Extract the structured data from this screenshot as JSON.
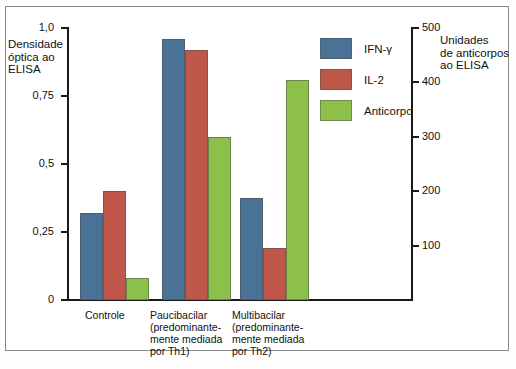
{
  "chart_data": {
    "type": "bar",
    "title": "",
    "categories": [
      "Controle",
      "Paucibacilar (predominantemente mediada por Th1)",
      "Multibacilar (predominantemente mediada por Th2)"
    ],
    "category_lines": [
      [
        "Controle"
      ],
      [
        "Paucibacilar",
        "(predominante-",
        "mente mediada",
        "por Th1)"
      ],
      [
        "Multibacilar",
        "(predominante-",
        "mente mediada",
        "por Th2)"
      ]
    ],
    "series": [
      {
        "name": "IFN-γ",
        "axis": "left",
        "color": "#4a7296",
        "values": [
          0.32,
          0.96,
          0.375
        ]
      },
      {
        "name": "IL-2",
        "axis": "left",
        "color": "#c0574b",
        "values": [
          0.4,
          0.92,
          0.19
        ]
      },
      {
        "name": "Anticorpo",
        "axis": "right",
        "color": "#8cc04a",
        "values": [
          0.08,
          0.6,
          0.81
        ]
      }
    ],
    "anticorpo_right_axis_values": [
      40,
      300,
      405
    ],
    "ylabel": "Densidade óptica ao ELISA",
    "ylabel_lines": [
      "Densidade",
      "óptica ao",
      "ELISA"
    ],
    "ylabel_right": "Unidades de anticorpos ao ELISA",
    "ylabel_right_lines": [
      "Unidades",
      "de anticorpos",
      "ao ELISA"
    ],
    "xlabel": "",
    "ylim": [
      0,
      1.0
    ],
    "ylim_right": [
      0,
      500
    ],
    "yticks": [
      0,
      0.25,
      0.5,
      0.75,
      1.0
    ],
    "ytick_labels": [
      "0",
      "0,25",
      "0,5",
      "0,75",
      "1,0"
    ],
    "yticks_right": [
      100,
      200,
      300,
      400,
      500
    ],
    "ytick_labels_right": [
      "100",
      "200",
      "300",
      "400",
      "500"
    ],
    "grid": false,
    "legend_position": "top-right"
  },
  "legend": {
    "items": [
      {
        "label": "IFN-γ",
        "color": "#4a7296"
      },
      {
        "label": "IL-2",
        "color": "#c0574b"
      },
      {
        "label": "Anticorpo",
        "color": "#8cc04a"
      }
    ]
  },
  "colors": {
    "ifn_gamma": "#4a7296",
    "il2": "#c0574b",
    "anticorpo": "#8cc04a",
    "axis": "#1a1a1a",
    "frame": "#8a8a8a",
    "background": "#ffffff"
  }
}
